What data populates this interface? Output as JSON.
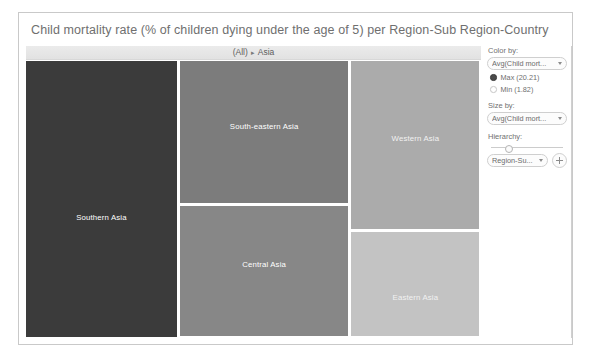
{
  "viz": {
    "title": "Child mortality rate (% of children dying under the age of 5) per Region-Sub Region-Country",
    "breadcrumb": {
      "root": "(All)",
      "separator": "▸",
      "current": "Asia"
    }
  },
  "controls": {
    "color_by": {
      "label": "Color by:",
      "value": "Avg(Child mort...",
      "caret_icon": "chevron-down-icon"
    },
    "legend": {
      "max": {
        "label": "Max (20.21)",
        "selected": true
      },
      "min": {
        "label": "Min (1.82)",
        "selected": false
      }
    },
    "size_by": {
      "label": "Size by:",
      "value": "Avg(Child mort...",
      "caret_icon": "chevron-down-icon"
    },
    "hierarchy": {
      "label": "Hierarchy:",
      "value": "Region-Su...",
      "caret_icon": "chevron-down-icon",
      "add_icon": "plus-icon"
    }
  },
  "chart_data": {
    "type": "treemap",
    "title": "Child mortality rate (% of children dying under the age of 5) per Region-Sub Region-Country",
    "value_label": "Avg(Child mortality rate)",
    "size_label": "Avg(Child mortality rate)",
    "color_scale": {
      "min": 1.82,
      "max": 20.21,
      "min_color": "#d4d4d4",
      "max_color": "#3a3a3a"
    },
    "drill_path": [
      "(All)",
      "Asia"
    ],
    "legend_position": "right",
    "nodes": [
      {
        "label": "Southern Asia",
        "value": 20.21,
        "color": "#3b3b3b",
        "x": 0,
        "y": 0,
        "w": 0.335,
        "h": 1.0,
        "label_y": 0.565
      },
      {
        "label": "South-eastern Asia",
        "value": 8.6,
        "color": "#7c7c7c",
        "x": 0.339,
        "y": 0,
        "w": 0.372,
        "h": 0.518,
        "label_y": 0.46
      },
      {
        "label": "Central Asia",
        "value": 7.9,
        "color": "#878787",
        "x": 0.339,
        "y": 0.522,
        "w": 0.372,
        "h": 0.478,
        "label_y": 0.445
      },
      {
        "label": "Western Asia",
        "value": 4.5,
        "color": "#ababab",
        "x": 0.715,
        "y": 0,
        "w": 0.285,
        "h": 0.613,
        "label_y": 0.46
      },
      {
        "label": "Eastern Asia",
        "value": 1.82,
        "color": "#c3c3c3",
        "x": 0.715,
        "y": 0.617,
        "w": 0.285,
        "h": 0.383,
        "label_y": 0.62
      }
    ]
  }
}
